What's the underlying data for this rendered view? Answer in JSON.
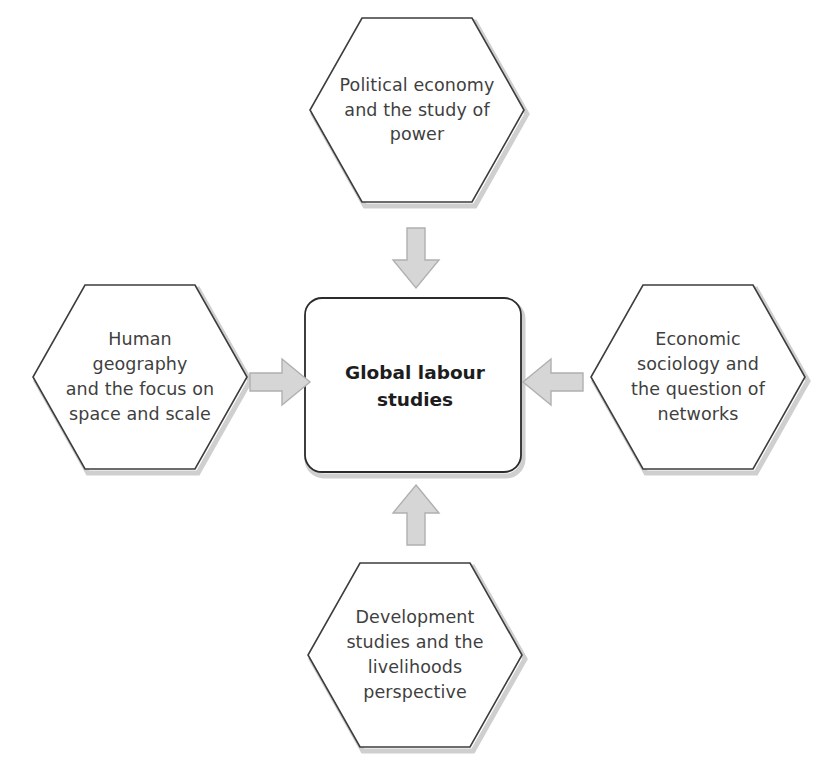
{
  "diagram": {
    "center": {
      "label": "Global labour\nstudies",
      "shape": "rounded-rectangle"
    },
    "nodes": [
      {
        "id": "political-economy",
        "position": "top",
        "label": "Political economy\nand the study of\npower",
        "shape": "hexagon"
      },
      {
        "id": "human-geography",
        "position": "left",
        "label": "Human geography\nand the focus on\nspace and scale",
        "shape": "hexagon"
      },
      {
        "id": "economic-sociology",
        "position": "right",
        "label": "Economic\nsociology and\nthe question of\nnetworks",
        "shape": "hexagon"
      },
      {
        "id": "development-studies",
        "position": "bottom",
        "label": "Development\nstudies and the\nlivelihoods\nperspective",
        "shape": "hexagon"
      }
    ],
    "arrows": [
      {
        "id": "arrow-top",
        "icon": "arrow-down-icon",
        "from": "political-economy",
        "to": "center",
        "direction": "down"
      },
      {
        "id": "arrow-left",
        "icon": "arrow-right-icon",
        "from": "human-geography",
        "to": "center",
        "direction": "right"
      },
      {
        "id": "arrow-right",
        "icon": "arrow-left-icon",
        "from": "economic-sociology",
        "to": "center",
        "direction": "left"
      },
      {
        "id": "arrow-bottom",
        "icon": "arrow-up-icon",
        "from": "development-studies",
        "to": "center",
        "direction": "up"
      }
    ],
    "colors": {
      "background": "#ffffff",
      "shape_fill": "#ffffff",
      "shape_stroke": "#3d3d3d",
      "node_text": "#3f3f3f",
      "center_text": "#1d1d1d",
      "arrow_fill": "#d6d6d6",
      "arrow_stroke": "#b3b3b3",
      "shadow": "#a8a8a8"
    }
  }
}
